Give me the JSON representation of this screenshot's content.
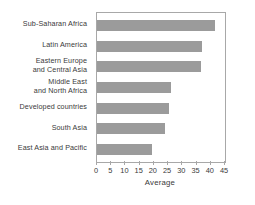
{
  "chart_data": {
    "type": "bar",
    "orientation": "horizontal",
    "title": "",
    "xlabel": "Average",
    "ylabel": "",
    "xlim": [
      0,
      45
    ],
    "xticks": [
      0,
      5,
      10,
      15,
      20,
      25,
      30,
      35,
      40,
      45
    ],
    "grid": false,
    "legend": null,
    "bar_color": "#9b9b9b",
    "categories": [
      "Sub-Saharan Africa",
      "Latin America",
      "Eastern Europe\nand Central Asia",
      "Middle East\nand North Africa",
      "Developed countries",
      "South Asia",
      "East Asia and Pacific"
    ],
    "values": [
      41.5,
      36.8,
      36.5,
      26.0,
      25.2,
      24.0,
      19.4
    ]
  }
}
